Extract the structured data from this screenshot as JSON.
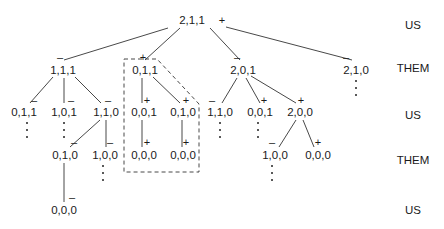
{
  "diagram": {
    "type": "game-tree",
    "root": {
      "label": "2,1,1",
      "mark": "+"
    },
    "row_labels": [
      "US",
      "THEM",
      "US",
      "THEM",
      "US"
    ],
    "nodes": [
      {
        "id": "n0",
        "label": "2,1,1",
        "mark": "+",
        "x": 192,
        "y": 20,
        "mx": 222,
        "my": 20
      },
      {
        "id": "n1",
        "label": "1,1,1",
        "mark": "–",
        "x": 63,
        "y": 70,
        "mx": 60,
        "my": 57
      },
      {
        "id": "n2",
        "label": "0,1,1",
        "mark": "+",
        "x": 145,
        "y": 70,
        "mx": 143,
        "my": 57
      },
      {
        "id": "n3",
        "label": "2,0,1",
        "mark": "–",
        "x": 243,
        "y": 70,
        "mx": 237,
        "my": 57
      },
      {
        "id": "n4",
        "label": "2,1,0",
        "mark": "–",
        "x": 356,
        "y": 70,
        "mx": 346,
        "my": 57
      },
      {
        "id": "n5",
        "label": "0,1,1",
        "mark": "–",
        "x": 24,
        "y": 112,
        "mx": 34,
        "my": 100
      },
      {
        "id": "n6",
        "label": "1,0,1",
        "mark": "–",
        "x": 64,
        "y": 112,
        "mx": 71,
        "my": 100
      },
      {
        "id": "n7",
        "label": "1,1,0",
        "mark": "–",
        "x": 106,
        "y": 112,
        "mx": 108,
        "my": 100
      },
      {
        "id": "n8",
        "label": "0,0,1",
        "mark": "+",
        "x": 144,
        "y": 112,
        "mx": 147,
        "my": 100
      },
      {
        "id": "n9",
        "label": "0,1,0",
        "mark": "+",
        "x": 183,
        "y": 112,
        "mx": 186,
        "my": 100
      },
      {
        "id": "n10",
        "label": "1,1,0",
        "mark": "–",
        "x": 220,
        "y": 112,
        "mx": 212,
        "my": 100
      },
      {
        "id": "n11",
        "label": "0,0,1",
        "mark": "+",
        "x": 260,
        "y": 112,
        "mx": 264,
        "my": 100
      },
      {
        "id": "n12",
        "label": "2,0,0",
        "mark": "+",
        "x": 300,
        "y": 112,
        "mx": 301,
        "my": 100
      },
      {
        "id": "n13",
        "label": "0,1,0",
        "mark": "–",
        "x": 65,
        "y": 155,
        "mx": 74,
        "my": 142
      },
      {
        "id": "n14",
        "label": "1,0,0",
        "mark": "–",
        "x": 105,
        "y": 155,
        "mx": 110,
        "my": 142
      },
      {
        "id": "n15",
        "label": "0,0,0",
        "mark": "+",
        "x": 144,
        "y": 155,
        "mx": 147,
        "my": 142
      },
      {
        "id": "n16",
        "label": "0,0,0",
        "mark": "+",
        "x": 183,
        "y": 155,
        "mx": 186,
        "my": 142
      },
      {
        "id": "n17",
        "label": "1,0,0",
        "mark": "–",
        "x": 275,
        "y": 155,
        "mx": 272,
        "my": 142
      },
      {
        "id": "n18",
        "label": "0,0,0",
        "mark": "+",
        "x": 318,
        "y": 155,
        "mx": 318,
        "my": 142
      },
      {
        "id": "n19",
        "label": "0,0,0",
        "mark": "–",
        "x": 64,
        "y": 210,
        "mx": 72,
        "my": 197
      }
    ],
    "edges": [
      [
        "n0",
        "n1"
      ],
      [
        "n0",
        "n2"
      ],
      [
        "n0",
        "n3"
      ],
      [
        "n0",
        "n4"
      ],
      [
        "n1",
        "n5"
      ],
      [
        "n1",
        "n6"
      ],
      [
        "n1",
        "n7"
      ],
      [
        "n2",
        "n8"
      ],
      [
        "n2",
        "n9"
      ],
      [
        "n3",
        "n10"
      ],
      [
        "n3",
        "n11"
      ],
      [
        "n3",
        "n12"
      ],
      [
        "n7",
        "n13"
      ],
      [
        "n7",
        "n14"
      ],
      [
        "n8",
        "n15"
      ],
      [
        "n9",
        "n16"
      ],
      [
        "n12",
        "n17"
      ],
      [
        "n12",
        "n18"
      ],
      [
        "n13",
        "n19"
      ]
    ],
    "continuation_dots_under": [
      "n4",
      "n5",
      "n6",
      "n10",
      "n11",
      "n14",
      "n17"
    ],
    "highlighted_subtree": "n2"
  }
}
